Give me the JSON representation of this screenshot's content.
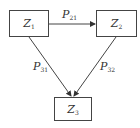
{
  "nodes": [
    {
      "id": "z1",
      "base": "Z",
      "sub": "1"
    },
    {
      "id": "z2",
      "base": "Z",
      "sub": "2"
    },
    {
      "id": "z3",
      "base": "Z",
      "sub": "3"
    }
  ],
  "edges": [
    {
      "from": "z1",
      "to": "z2",
      "base": "P",
      "sub": "21"
    },
    {
      "from": "z1",
      "to": "z3",
      "base": "P",
      "sub": "31"
    },
    {
      "from": "z2",
      "to": "z3",
      "base": "P",
      "sub": "32"
    }
  ],
  "colors": {
    "line": "#444444",
    "text": "#333333"
  }
}
